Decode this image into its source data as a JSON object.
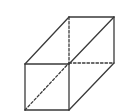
{
  "diagram": {
    "title": "",
    "type": "cuboid-wireframe",
    "stroke_color": "#3a3a3a",
    "background": "#ffffff",
    "vertices": {
      "front_top_left": [
        25,
        64
      ],
      "front_top_right": [
        69,
        64
      ],
      "front_bottom_left": [
        25,
        110
      ],
      "front_bottom_right": [
        69,
        110
      ],
      "back_top_left": [
        69,
        17
      ],
      "back_top_right": [
        114,
        17
      ],
      "back_bottom_right": [
        114,
        63
      ],
      "back_bottom_left_hidden": [
        69,
        63
      ]
    },
    "solid_edges": [
      [
        [
          25,
          64
        ],
        [
          69,
          64
        ]
      ],
      [
        [
          69,
          64
        ],
        [
          69,
          110
        ]
      ],
      [
        [
          69,
          110
        ],
        [
          25,
          110
        ]
      ],
      [
        [
          25,
          110
        ],
        [
          25,
          64
        ]
      ],
      [
        [
          25,
          64
        ],
        [
          69,
          17
        ]
      ],
      [
        [
          69,
          17
        ],
        [
          114,
          17
        ]
      ],
      [
        [
          114,
          17
        ],
        [
          69,
          64
        ]
      ],
      [
        [
          114,
          17
        ],
        [
          114,
          63
        ]
      ],
      [
        [
          114,
          63
        ],
        [
          69,
          110
        ]
      ]
    ],
    "dashed_edges": [
      [
        [
          69,
          17
        ],
        [
          69,
          63
        ]
      ],
      [
        [
          69,
          63
        ],
        [
          114,
          63
        ]
      ],
      [
        [
          25,
          110
        ],
        [
          69,
          63
        ]
      ]
    ]
  }
}
